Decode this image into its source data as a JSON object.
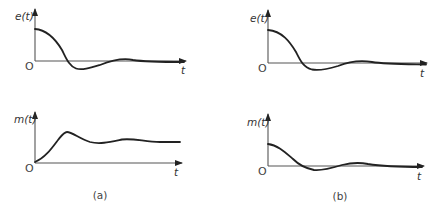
{
  "figure": {
    "panels": [
      {
        "caption": "(a)",
        "plots": [
          {
            "ylabel": "e(t)",
            "xlabel": "t",
            "origin": "O",
            "description": "damped oscillation starting at positive value, decaying to zero"
          },
          {
            "ylabel": "m(t)",
            "xlabel": "t",
            "origin": "O",
            "description": "rises from zero, overshoots, settles to nonzero steady value"
          }
        ]
      },
      {
        "caption": "(b)",
        "plots": [
          {
            "ylabel": "e(t)",
            "xlabel": "t",
            "origin": "O",
            "description": "damped oscillation starting at positive value, decaying to zero"
          },
          {
            "ylabel": "m(t)",
            "xlabel": "t",
            "origin": "O",
            "description": "starts at positive value, damped oscillation decaying to zero"
          }
        ]
      }
    ]
  },
  "colors": {
    "curve": "#222222",
    "axis": "#555555",
    "background": "#ffffff"
  }
}
